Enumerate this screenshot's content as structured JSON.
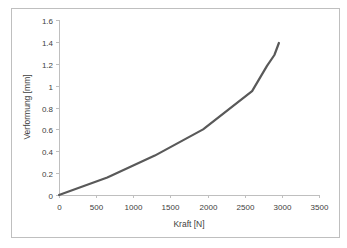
{
  "chart_data": {
    "type": "line",
    "title": "",
    "xlabel": "Kraft [N]",
    "ylabel": "Verformung [mm]",
    "xlim": [
      0,
      3500
    ],
    "ylim": [
      0,
      1.6
    ],
    "xticks": [
      0,
      500,
      1000,
      1500,
      2000,
      2500,
      3000,
      3500
    ],
    "yticks": [
      0,
      0.2,
      0.4,
      0.6,
      0.8,
      1,
      1.2,
      1.4,
      1.6
    ],
    "xtick_labels": [
      "0",
      "500",
      "1000",
      "1500",
      "2000",
      "2500",
      "3000",
      "3500"
    ],
    "ytick_labels": [
      "0",
      "0.2",
      "0.4",
      "0.6",
      "0.8",
      "1",
      "1.2",
      "1.4",
      "1.6"
    ],
    "grid": false,
    "legend": null,
    "series": [
      {
        "name": "Verformung",
        "color": "#595959",
        "x": [
          0,
          650,
          1290,
          1940,
          2600,
          2800,
          2900,
          2960
        ],
        "y": [
          0,
          0.16,
          0.36,
          0.6,
          0.95,
          1.18,
          1.28,
          1.39
        ]
      }
    ]
  }
}
